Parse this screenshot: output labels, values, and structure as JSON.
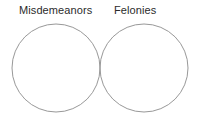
{
  "diagram": {
    "type": "venn",
    "title": "",
    "background_color": "#ffffff",
    "stroke_color": "#8c8c8c",
    "text_color": "#2b2b2b",
    "sets": [
      {
        "id": "left",
        "label": "Misdemeanors",
        "label_position": "top-left",
        "center_x": 56,
        "center_y": 68,
        "radius": 44,
        "contents": []
      },
      {
        "id": "right",
        "label": "Felonies",
        "label_position": "top-right",
        "center_x": 144,
        "center_y": 68,
        "radius": 44,
        "contents": []
      }
    ],
    "intersection": {
      "label": "",
      "contents": []
    }
  }
}
